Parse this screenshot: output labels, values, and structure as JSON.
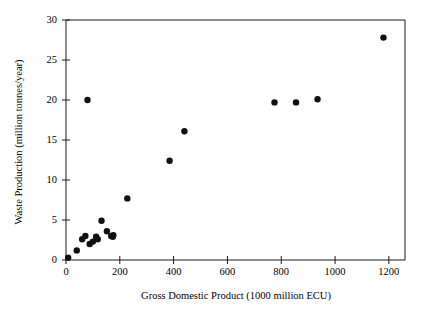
{
  "chart_data": {
    "type": "scatter",
    "title": "",
    "xlabel": "Gross Domestic Product (1000 million ECU)",
    "ylabel": "Waste Production (million tonnes/year)",
    "xlim": [
      0,
      1260
    ],
    "ylim": [
      0,
      30
    ],
    "xticks": [
      0,
      200,
      400,
      600,
      800,
      1000,
      1200
    ],
    "xticklabels": [
      "0",
      "200",
      "400",
      "600",
      "800",
      "1000",
      "1200"
    ],
    "yticks": [
      0,
      5,
      10,
      15,
      20,
      25,
      30
    ],
    "yticklabels": [
      "0",
      "5",
      "10",
      "15",
      "20",
      "25",
      "30"
    ],
    "grid": false,
    "legend": null,
    "marker": "filled-circle",
    "marker_color": "#111111",
    "marker_size_px": 3.2,
    "points": [
      {
        "x": 8,
        "y": 0.3
      },
      {
        "x": 40,
        "y": 1.2
      },
      {
        "x": 60,
        "y": 2.6
      },
      {
        "x": 72,
        "y": 3.0
      },
      {
        "x": 88,
        "y": 2.0
      },
      {
        "x": 100,
        "y": 2.3
      },
      {
        "x": 112,
        "y": 2.9
      },
      {
        "x": 118,
        "y": 2.6
      },
      {
        "x": 132,
        "y": 4.9
      },
      {
        "x": 152,
        "y": 3.6
      },
      {
        "x": 168,
        "y": 3.0
      },
      {
        "x": 174,
        "y": 2.9
      },
      {
        "x": 176,
        "y": 3.1
      },
      {
        "x": 80,
        "y": 20.0
      },
      {
        "x": 228,
        "y": 7.7
      },
      {
        "x": 385,
        "y": 12.4
      },
      {
        "x": 440,
        "y": 16.1
      },
      {
        "x": 775,
        "y": 19.7
      },
      {
        "x": 855,
        "y": 19.7
      },
      {
        "x": 935,
        "y": 20.1
      },
      {
        "x": 1180,
        "y": 27.8
      }
    ]
  },
  "figure": {
    "background": "#ffffff",
    "axis_color": "#1a1a1a"
  }
}
